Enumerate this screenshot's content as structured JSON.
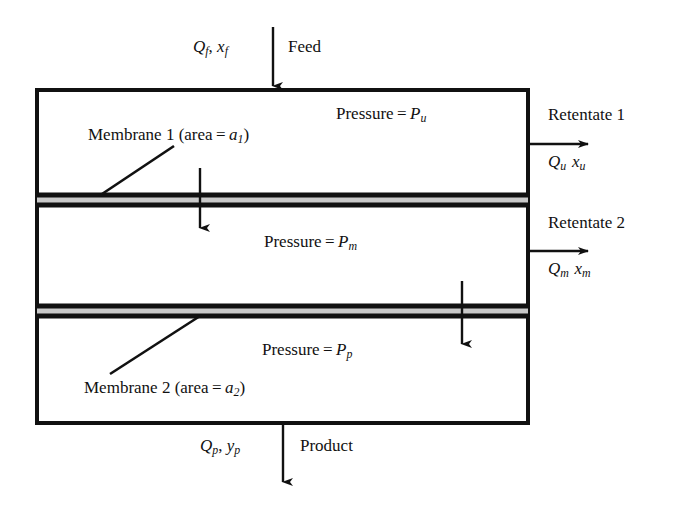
{
  "diagram": {
    "stroke_color": "#111111",
    "membrane_fill_color": "#c9c9c9",
    "background_color": "#ffffff",
    "streams": {
      "feed": {
        "name_label": "Feed",
        "flow_label": "Qf, xf",
        "flow_rate_symbol": "Q",
        "flow_rate_subscript": "f",
        "composition_symbol": "x",
        "composition_subscript": "f",
        "direction": "down"
      },
      "retentate_1": {
        "name_label": "Retentate 1",
        "flow_label": "Qu xu",
        "flow_rate_symbol": "Q",
        "flow_rate_subscript": "u",
        "composition_symbol": "x",
        "composition_subscript": "u",
        "direction": "right"
      },
      "retentate_2": {
        "name_label": "Retentate 2",
        "flow_label": "Qm xm",
        "flow_rate_symbol": "Q",
        "flow_rate_subscript": "m",
        "composition_symbol": "x",
        "composition_subscript": "m",
        "direction": "right"
      },
      "product": {
        "name_label": "Product",
        "flow_label": "Qp, yp",
        "flow_rate_symbol": "Q",
        "flow_rate_subscript": "p",
        "composition_symbol": "y",
        "composition_subscript": "p",
        "direction": "down"
      }
    },
    "chambers": {
      "upper": {
        "pressure_label": "Pressure = Pu",
        "pressure_prefix": "Pressure =",
        "pressure_symbol": "P",
        "pressure_subscript": "u"
      },
      "middle": {
        "pressure_label": "Pressure = Pm",
        "pressure_prefix": "Pressure =",
        "pressure_symbol": "P",
        "pressure_subscript": "m"
      },
      "lower": {
        "pressure_label": "Pressure = Pp",
        "pressure_prefix": "Pressure =",
        "pressure_symbol": "P",
        "pressure_subscript": "p"
      }
    },
    "membranes": {
      "membrane_1": {
        "label": "Membrane 1 (area = a1)",
        "name_prefix": "Membrane 1 (area =",
        "area_symbol": "a",
        "area_subscript": "1",
        "suffix": ")"
      },
      "membrane_2": {
        "label": "Membrane 2 (area = a2)",
        "name_prefix": "Membrane 2 (area =",
        "area_symbol": "a",
        "area_subscript": "2",
        "suffix": ")"
      }
    },
    "permeation_arrows": [
      {
        "name": "permeate-through-membrane-1",
        "direction": "down"
      },
      {
        "name": "permeate-through-membrane-2",
        "direction": "down"
      }
    ]
  }
}
